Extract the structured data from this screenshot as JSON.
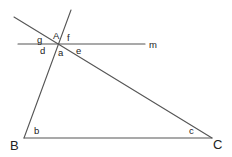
{
  "diagram": {
    "type": "geometry",
    "line_color": "#555555",
    "text_color": "#222222",
    "vertices": {
      "A": {
        "label": "A",
        "x": 59,
        "y": 44
      },
      "B": {
        "label": "B",
        "x": 24,
        "y": 138
      },
      "C": {
        "label": "C",
        "x": 212,
        "y": 138
      }
    },
    "lines": {
      "m": {
        "label": "m",
        "from": [
          18,
          44
        ],
        "to": [
          145,
          44
        ]
      },
      "AB_extended": {
        "from": [
          71,
          10
        ],
        "to": [
          24,
          138
        ]
      },
      "AC_extended": {
        "from": [
          14,
          17
        ],
        "to": [
          212,
          138
        ]
      },
      "BC": {
        "from": [
          24,
          138
        ],
        "to": [
          212,
          138
        ]
      }
    },
    "angle_labels": {
      "a": "a",
      "b": "b",
      "c": "c",
      "d": "d",
      "e": "e",
      "f": "f",
      "g": "g"
    },
    "vertex_labels": {
      "A": "A",
      "B": "B",
      "C": "C"
    },
    "line_labels": {
      "m": "m"
    }
  }
}
